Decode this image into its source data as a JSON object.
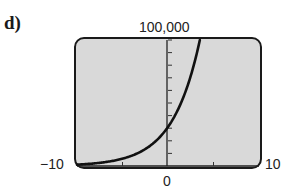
{
  "part_label": "d)",
  "chart_data": {
    "type": "line",
    "title": "",
    "xlabel": "",
    "ylabel": "",
    "xlim": [
      -10,
      10
    ],
    "ylim": [
      0,
      100000
    ],
    "x_tick_labels": {
      "min": "−10",
      "max": "10",
      "origin": "0"
    },
    "y_tick_labels": {
      "max": "100,000"
    },
    "x_tick_step": 5,
    "y_tick_step": 10000,
    "grid": false,
    "background": "#d9d9d9",
    "line_color": "#111111",
    "series": [
      {
        "name": "exponential growth",
        "equation_approx": "y = 31000 * 1.4^x",
        "x": [
          -10,
          -8,
          -6,
          -4,
          -2,
          0,
          1,
          2,
          3,
          3.5
        ],
        "values": [
          1070,
          2100,
          4100,
          8100,
          15800,
          31000,
          43400,
          60800,
          85100,
          100000
        ]
      }
    ]
  }
}
